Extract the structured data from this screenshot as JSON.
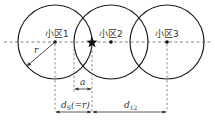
{
  "diagram": {
    "cells": [
      {
        "label": "小区1",
        "cx": 55,
        "cy": 42,
        "r": 37
      },
      {
        "label": "小区2",
        "cx": 111,
        "cy": 42,
        "r": 37
      },
      {
        "label": "小区3",
        "cx": 167,
        "cy": 42,
        "r": 37
      }
    ],
    "star_position": {
      "x": 92,
      "y": 42
    },
    "radius_label": "r",
    "offset_label": "a",
    "ds_label_main": "d",
    "ds_label_sub": "S",
    "ds_label_suffix": "(=r)",
    "d12_label_main": "d",
    "d12_label_sub": "12",
    "colors": {
      "stroke": "#222222",
      "dashed": "#777777",
      "text": "#333333"
    }
  }
}
